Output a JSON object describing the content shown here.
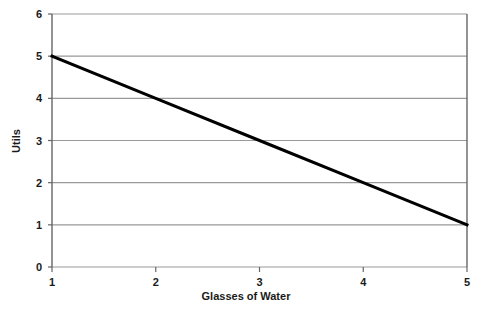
{
  "chart_data": {
    "type": "line",
    "title": "",
    "subtitle": "",
    "xlabel": "Glasses of Water",
    "ylabel": "Utils",
    "x": [
      1,
      2,
      3,
      4,
      5
    ],
    "series": [
      {
        "name": "Marginal Utility",
        "values": [
          5,
          4,
          3,
          2,
          1
        ]
      }
    ],
    "xlim": [
      1,
      5
    ],
    "ylim": [
      0,
      6
    ],
    "xticks": [
      1,
      2,
      3,
      4,
      5
    ],
    "yticks": [
      0,
      1,
      2,
      3,
      4,
      5,
      6
    ],
    "xtick_labels": [
      "1",
      "2",
      "3",
      "4",
      "5"
    ],
    "ytick_labels": [
      "0",
      "1",
      "2",
      "3",
      "4",
      "5",
      "6"
    ],
    "grid": "horizontal",
    "legend": "none",
    "colors": {
      "line": "#000000",
      "grid": "#999999",
      "axis": "#666666",
      "text": "#1a1a1a",
      "background": "#ffffff"
    },
    "line_width": 3
  }
}
